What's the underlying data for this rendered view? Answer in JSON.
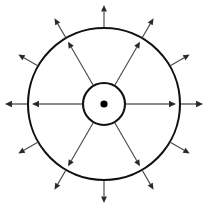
{
  "figure": {
    "background_color": "#ffffff",
    "width": 216,
    "height": 209,
    "center": {
      "x": 104,
      "y": 104
    },
    "stroke_color": "#111111",
    "line_color": "#4a4a4a",
    "axis_color": "#8a8a8a",
    "dot_color": "#000000"
  },
  "chart_data": {
    "type": "scatter",
    "xlabel": "",
    "ylabel": "",
    "grid": false,
    "legend": "none",
    "xlim": [
      0,
      216
    ],
    "ylim": [
      0,
      209
    ],
    "annotations": [],
    "shapes": [
      {
        "name": "center-dot",
        "kind": "circle",
        "cx": 104,
        "cy": 104,
        "r": 3.6,
        "filled": true,
        "color": "#000000"
      },
      {
        "name": "inner-circle",
        "kind": "circle",
        "cx": 104,
        "cy": 104,
        "r": 21,
        "filled": false,
        "color": "#111111",
        "stroke_width": 2.1
      },
      {
        "name": "outer-circle",
        "kind": "circle",
        "cx": 104,
        "cy": 104,
        "r": 76,
        "filled": false,
        "color": "#111111",
        "stroke_width": 2.1
      }
    ],
    "inner_arrows": {
      "count": 6,
      "start_radius": 21,
      "end_radius": 72,
      "angles_deg": [
        0,
        60,
        120,
        180,
        240,
        300
      ],
      "direction": "outward",
      "description": "Six radial arrows from the inner circle to the outer circle"
    },
    "outer_arrows": {
      "count": 12,
      "start_radius": 77,
      "end_radius": 99,
      "angles_deg": [
        0,
        30,
        60,
        90,
        120,
        150,
        180,
        210,
        240,
        270,
        300,
        330
      ],
      "direction": "outward",
      "description": "Twelve radial arrows extending outward beyond the outer circle"
    },
    "horizontal_axis": {
      "present": true,
      "angles_deg": [
        0,
        180
      ],
      "description": "Horizontal radial arrows drawn with a heavier grey stroke"
    }
  }
}
